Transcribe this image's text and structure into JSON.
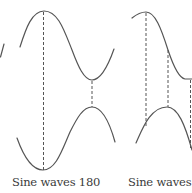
{
  "figure": {
    "stroke_color": "#555555",
    "dash_color": "#555555",
    "panels": [
      {
        "id": "left",
        "caption": "Sine waves 180",
        "phase_difference_deg": 180
      },
      {
        "id": "right",
        "caption": "Sine waves 90",
        "phase_difference_deg": 90
      }
    ]
  }
}
